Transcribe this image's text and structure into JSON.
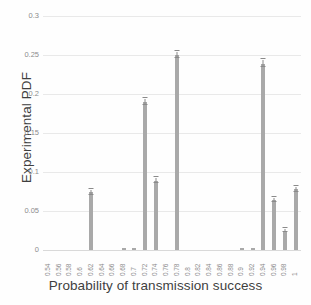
{
  "chart_data": {
    "type": "bar",
    "title": "",
    "xlabel": "Probability of transmission success",
    "ylabel": "Experimental PDF",
    "categories": [
      "0.54",
      "0.56",
      "0.58",
      "0.6",
      "0.62",
      "0.64",
      "0.66",
      "0.68",
      "0.7",
      "0.72",
      "0.74",
      "0.76",
      "0.78",
      "0.8",
      "0.82",
      "0.84",
      "0.86",
      "0.88",
      "0.9",
      "0.92",
      "0.94",
      "0.96",
      "0.98",
      "1"
    ],
    "values": [
      0,
      0,
      0,
      0,
      0.074,
      0,
      0,
      0.002,
      0.003,
      0.19,
      0.089,
      0,
      0.25,
      0,
      0,
      0,
      0,
      0,
      0.002,
      0.003,
      0.239,
      0.064,
      0.025,
      0.078
    ],
    "errors": [
      0,
      0,
      0,
      0,
      0.003,
      0,
      0,
      0.001,
      0.001,
      0.004,
      0.003,
      0,
      0.004,
      0,
      0,
      0,
      0,
      0,
      0.001,
      0.001,
      0.004,
      0.003,
      0.002,
      0.003
    ],
    "yticks": [
      "0",
      "0.05",
      "0.1",
      "0.15",
      "0.2",
      "0.25",
      "0.3"
    ],
    "ytickvalues": [
      0,
      0.05,
      0.1,
      0.15,
      0.2,
      0.25,
      0.3
    ],
    "ylim": [
      0,
      0.3
    ],
    "grid": true,
    "legend": false,
    "bar_color": "#a9a9a9",
    "grid_color": "#e9e9e9",
    "text_color": "#3f3f3f",
    "tick_color": "#8c8c8c"
  }
}
